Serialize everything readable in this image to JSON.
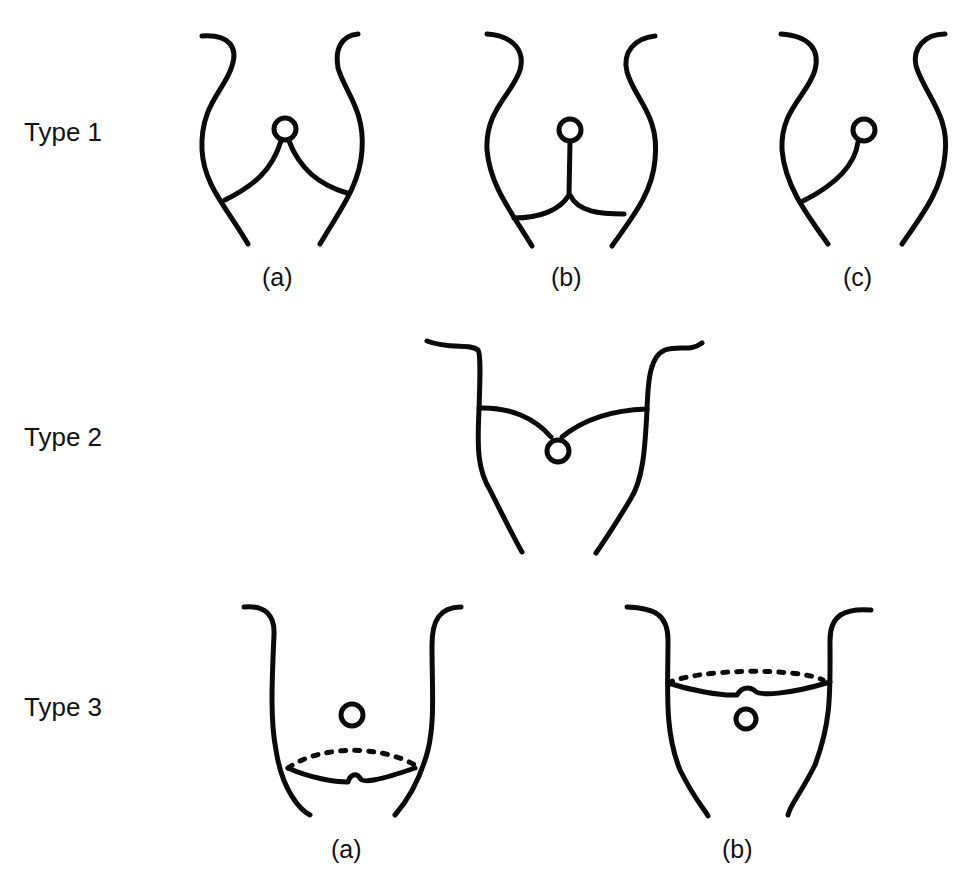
{
  "rows": [
    {
      "label": "Type 1",
      "figures": [
        {
          "caption": "(a)"
        },
        {
          "caption": "(b)"
        },
        {
          "caption": "(c)"
        }
      ]
    },
    {
      "label": "Type 2",
      "figures": [
        {
          "caption": ""
        }
      ]
    },
    {
      "label": "Type 3",
      "figures": [
        {
          "caption": "(a)"
        },
        {
          "caption": "(b)"
        }
      ]
    }
  ],
  "colors": {
    "line": "#0a0a0a",
    "background": "#ffffff"
  }
}
